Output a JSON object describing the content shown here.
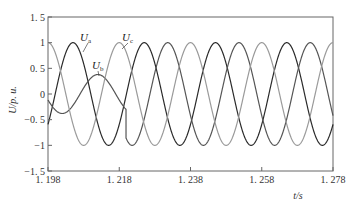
{
  "chart_data": {
    "type": "line",
    "title": "",
    "xlabel": "t/s",
    "ylabel": "U/p. u.",
    "xlim": [
      1.198,
      1.278
    ],
    "ylim": [
      -1.5,
      1.5
    ],
    "x_ticks": [
      1.198,
      1.218,
      1.238,
      1.258,
      1.278
    ],
    "x_tick_labels": [
      "1. 198",
      "1. 218",
      "1. 238",
      "1. 258",
      "1. 278"
    ],
    "y_ticks": [
      1.5,
      1,
      0.5,
      0,
      -0.5,
      -1,
      -1.5
    ],
    "y_tick_labels": [
      "1. 5",
      "1",
      "0. 5",
      "0",
      "−0. 5",
      "−1",
      "−1. 5"
    ],
    "grid": false,
    "legend": "inline labels",
    "frequency_hz": 50,
    "event_time_s": 1.2199,
    "series": [
      {
        "name": "Ua",
        "label_main": "U",
        "label_sub": "a",
        "color": "#2a2a2a",
        "amplitude": 1.0,
        "peak_time": 1.20502,
        "label_pos": [
          80,
          41
        ],
        "leader": [
          [
            88,
            43
          ],
          [
            83,
            52
          ]
        ]
      },
      {
        "name": "Ub",
        "label_main": "U",
        "label_sub": "b",
        "color": "#555555",
        "pre_event_amplitude": 0.38,
        "pre_event_peak_time": 1.212,
        "amplitude": 1.0,
        "peak_time": 1.21162,
        "label_pos": [
          92,
          69
        ],
        "leader": [
          [
            98,
            71
          ],
          [
            99,
            76
          ]
        ]
      },
      {
        "name": "Uc",
        "label_main": "U",
        "label_sub": "c",
        "color": "#9a9a9a",
        "amplitude": 1.0,
        "peak_time": 1.198,
        "label_pos": [
          122,
          41
        ],
        "leader": [
          [
            128,
            43
          ],
          [
            122,
            49
          ]
        ]
      }
    ]
  }
}
